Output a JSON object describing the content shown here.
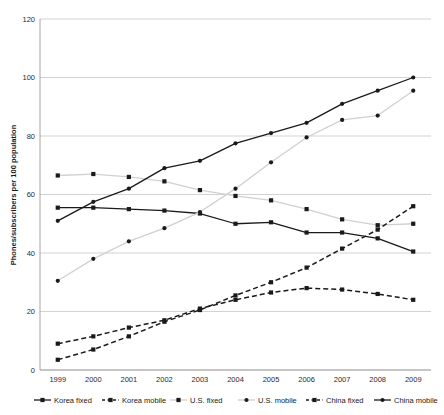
{
  "chart_data": {
    "type": "line",
    "title": "",
    "xlabel": "",
    "ylabel": "Phones/subscribers per 100 population",
    "ylim": [
      0,
      120
    ],
    "yticks": [
      0,
      20,
      40,
      60,
      80,
      100,
      120
    ],
    "grid": true,
    "legend_position": "bottom",
    "categories": [
      "1999",
      "2000",
      "2001",
      "2002",
      "2003",
      "2004",
      "2005",
      "2006",
      "2007",
      "2008",
      "2009"
    ],
    "series": [
      {
        "name": "Korea fixed",
        "color": "#1a1a1a",
        "style": "solid",
        "marker": "square",
        "values": [
          55.5,
          55.5,
          55,
          54.5,
          53.5,
          50,
          50.5,
          47,
          47,
          45,
          40.5
        ]
      },
      {
        "name": "Korea mobile",
        "color": "#1a1a1a",
        "style": "dashed",
        "marker": "square",
        "values": [
          9,
          11.5,
          14.5,
          17,
          21,
          24,
          26.5,
          28,
          27.5,
          26,
          24
        ]
      },
      {
        "name": "U.S. fixed",
        "color": "#d0d0d0",
        "style": "solid",
        "marker": "square",
        "values": [
          66.5,
          67,
          66,
          64.5,
          61.5,
          59.5,
          58,
          55,
          51.5,
          49.5,
          50
        ]
      },
      {
        "name": "U.S. mobile",
        "color": "#d0d0d0",
        "style": "solid",
        "marker": "circle",
        "values": [
          30.5,
          38,
          44,
          48.5,
          54,
          62,
          71,
          79.5,
          85.5,
          87,
          95.5
        ]
      },
      {
        "name": "China fixed",
        "color": "#1a1a1a",
        "style": "dashed",
        "marker": "square",
        "values": [
          3.5,
          7,
          11.5,
          16.5,
          20.5,
          25.5,
          30,
          35,
          41.5,
          48,
          56
        ]
      },
      {
        "name": "China mobile",
        "color": "#1a1a1a",
        "style": "solid",
        "marker": "circle",
        "values": [
          51,
          57.5,
          62,
          69,
          71.5,
          77.5,
          81,
          84.5,
          91,
          95.5,
          100
        ]
      }
    ]
  },
  "legend": {
    "items": [
      {
        "label": "Korea fixed"
      },
      {
        "label": "Korea mobile"
      },
      {
        "label": "U.S. fixed"
      },
      {
        "label": "U.S. mobile"
      },
      {
        "label": "China fixed"
      },
      {
        "label": "China mobile"
      }
    ]
  }
}
